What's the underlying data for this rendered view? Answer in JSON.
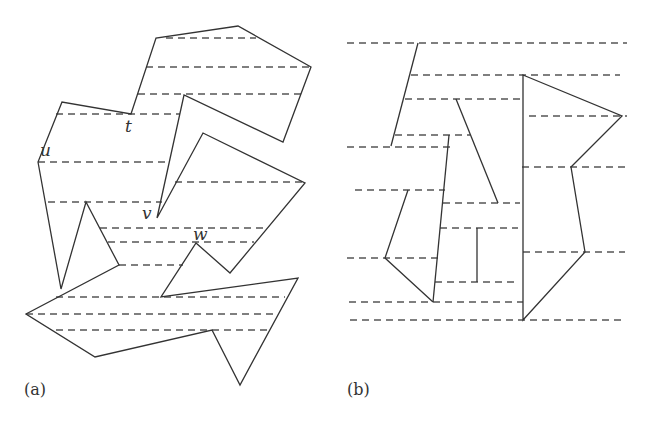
{
  "figure": {
    "panel_a": {
      "caption": "(a)",
      "vertex_labels": [
        {
          "id": "t",
          "text": "t",
          "x": 125,
          "y": 96
        },
        {
          "id": "u",
          "text": "u",
          "x": 40,
          "y": 142
        },
        {
          "id": "v",
          "text": "v",
          "x": 142,
          "y": 202
        },
        {
          "id": "w",
          "text": "w",
          "x": 192,
          "y": 225
        }
      ],
      "polygon": [
        [
          38,
          162
        ],
        [
          61,
          289
        ],
        [
          86,
          202
        ],
        [
          119,
          265
        ],
        [
          26,
          314
        ],
        [
          95,
          357
        ],
        [
          212,
          330
        ],
        [
          240,
          385
        ],
        [
          298,
          278
        ],
        [
          161,
          297
        ],
        [
          196,
          243
        ],
        [
          230,
          273
        ],
        [
          305,
          183
        ],
        [
          203,
          133
        ],
        [
          157,
          218
        ],
        [
          184,
          95
        ],
        [
          283,
          142
        ],
        [
          311,
          67
        ],
        [
          238,
          26
        ],
        [
          156,
          38
        ],
        [
          131,
          114
        ],
        [
          62,
          102
        ]
      ],
      "trapezoid_lines": [
        [
          [
            166,
            38
          ],
          [
            256,
            38
          ]
        ],
        [
          [
            146,
            67
          ],
          [
            311,
            67
          ]
        ],
        [
          [
            138,
            94
          ],
          [
            302,
            94
          ]
        ],
        [
          [
            56,
            114
          ],
          [
            180,
            114
          ]
        ],
        [
          [
            38,
            162
          ],
          [
            168,
            162
          ]
        ],
        [
          [
            175,
            182
          ],
          [
            305,
            182
          ]
        ],
        [
          [
            48,
            202
          ],
          [
            162,
            202
          ]
        ],
        [
          [
            100,
            228
          ],
          [
            268,
            228
          ]
        ],
        [
          [
            108,
            242
          ],
          [
            254,
            242
          ]
        ],
        [
          [
            119,
            265
          ],
          [
            183,
            265
          ]
        ],
        [
          [
            56,
            297
          ],
          [
            285,
            297
          ]
        ],
        [
          [
            26,
            314
          ],
          [
            276,
            314
          ]
        ],
        [
          [
            56,
            330
          ],
          [
            270,
            330
          ]
        ]
      ]
    },
    "panel_b": {
      "caption": "(b)",
      "segments": [
        [
          [
            418,
            43
          ],
          [
            391,
            146
          ]
        ],
        [
          [
            456,
            99
          ],
          [
            498,
            203
          ]
        ],
        [
          [
            449,
            135
          ],
          [
            433,
            302
          ]
        ],
        [
          [
            408,
            190
          ],
          [
            385,
            258
          ],
          [
            433,
            302
          ]
        ],
        [
          [
            477,
            228
          ],
          [
            477,
            282
          ]
        ]
      ],
      "polygon": [
        [
          523,
          75
        ],
        [
          622,
          116
        ],
        [
          571,
          167
        ],
        [
          585,
          252
        ],
        [
          523,
          320
        ]
      ],
      "trapezoid_lines": [
        [
          [
            347,
            43
          ],
          [
            627,
            43
          ]
        ],
        [
          [
            411,
            75
          ],
          [
            620,
            75
          ]
        ],
        [
          [
            405,
            99
          ],
          [
            522,
            99
          ]
        ],
        [
          [
            395,
            135
          ],
          [
            470,
            135
          ]
        ],
        [
          [
            347,
            147
          ],
          [
            450,
            147
          ]
        ],
        [
          [
            529,
            116
          ],
          [
            627,
            116
          ]
        ],
        [
          [
            522,
            167
          ],
          [
            625,
            167
          ]
        ],
        [
          [
            355,
            190
          ],
          [
            445,
            190
          ]
        ],
        [
          [
            443,
            203
          ],
          [
            520,
            203
          ]
        ],
        [
          [
            440,
            228
          ],
          [
            518,
            228
          ]
        ],
        [
          [
            347,
            258
          ],
          [
            440,
            258
          ]
        ],
        [
          [
            523,
            252
          ],
          [
            625,
            252
          ]
        ],
        [
          [
            435,
            282
          ],
          [
            515,
            282
          ]
        ],
        [
          [
            349,
            302
          ],
          [
            523,
            302
          ]
        ],
        [
          [
            350,
            320
          ],
          [
            623,
            320
          ]
        ]
      ]
    }
  }
}
